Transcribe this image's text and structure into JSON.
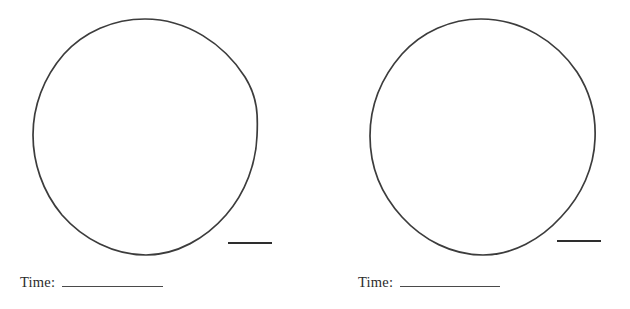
{
  "document": {
    "title": "Clock Drawing Worksheet",
    "background_color": "#ffffff",
    "ink_color": "#3a3a3a",
    "width": 630,
    "height": 309
  },
  "panels": [
    {
      "id": "left",
      "circle": {
        "name": "clock-face-circle",
        "center_x": 145,
        "center_y": 137,
        "radius_x": 112,
        "radius_y": 118,
        "stroke_color": "#3c3c3c",
        "stroke_width": 1.6,
        "fill": "none"
      },
      "marker_bar": {
        "name": "scale-bar",
        "x1": 228,
        "y1": 243,
        "x2": 272,
        "y2": 243,
        "stroke_color": "#2e2e2e",
        "stroke_width": 1.8
      },
      "time_field": {
        "label": "Time:",
        "value": "",
        "placeholder": ""
      }
    },
    {
      "id": "right",
      "circle": {
        "name": "clock-face-circle",
        "center_x": 480,
        "center_y": 137,
        "radius_x": 111,
        "radius_y": 118,
        "stroke_color": "#3c3c3c",
        "stroke_width": 1.6,
        "fill": "none"
      },
      "marker_bar": {
        "name": "scale-bar",
        "x1": 557,
        "y1": 241,
        "x2": 601,
        "y2": 241,
        "stroke_color": "#2e2e2e",
        "stroke_width": 1.8
      },
      "time_field": {
        "label": "Time:",
        "value": "",
        "placeholder": ""
      }
    }
  ]
}
